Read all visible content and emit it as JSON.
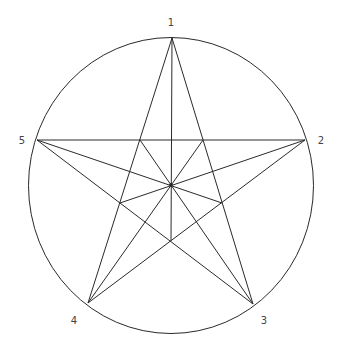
{
  "diagram": {
    "title": "",
    "stroke_color": "#2a2a2a",
    "label_color": "#444444",
    "circle": {
      "cx": 171,
      "cy": 185.5,
      "rx": 142.5,
      "ry": 148
    },
    "center": {
      "x": 171,
      "y": 185
    },
    "vertices": [
      {
        "label": "1",
        "x": 172,
        "y": 38,
        "lx": 171,
        "ly": 26
      },
      {
        "label": "2",
        "x": 305,
        "y": 140,
        "lx": 321,
        "ly": 144
      },
      {
        "label": "3",
        "x": 253,
        "y": 304,
        "lx": 264,
        "ly": 324
      },
      {
        "label": "4",
        "x": 88,
        "y": 303,
        "lx": 74,
        "ly": 324
      },
      {
        "label": "5",
        "x": 37,
        "y": 140,
        "lx": 22,
        "ly": 144
      }
    ],
    "inner_vertices": [
      {
        "x": 171,
        "y": 241
      },
      {
        "x": 120,
        "y": 203
      },
      {
        "x": 140,
        "y": 140
      },
      {
        "x": 203,
        "y": 140
      },
      {
        "x": 222,
        "y": 203
      }
    ]
  }
}
